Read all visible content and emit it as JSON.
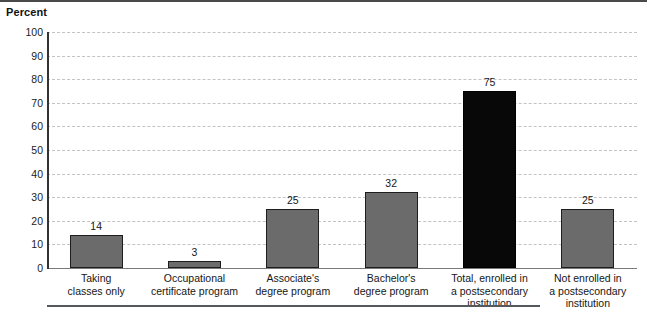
{
  "chart_data": {
    "type": "bar",
    "title": "",
    "ylabel": "Percent",
    "xlabel": "",
    "ylim": [
      0,
      100
    ],
    "yticks": [
      0,
      10,
      20,
      30,
      40,
      50,
      60,
      70,
      80,
      90,
      100
    ],
    "grid": true,
    "legend": "none",
    "categories": [
      "Taking\nclasses only",
      "Occupational\ncertificate program",
      "Associate's\ndegree program",
      "Bachelor's\ndegree program",
      "Total, enrolled in\na postsecondary\ninstitution",
      "Not enrolled in\na postsecondary\ninstitution"
    ],
    "values": [
      14,
      3,
      25,
      32,
      75,
      25
    ],
    "value_labels": [
      "14",
      "3",
      "25",
      "32",
      "75",
      "25"
    ],
    "bar_colors": [
      "#6b6b6b",
      "#6b6b6b",
      "#6b6b6b",
      "#6b6b6b",
      "#080808",
      "#6b6b6b"
    ]
  },
  "colors": {
    "bar_gray": "#6b6b6b",
    "bar_black": "#080808",
    "gridline": "#c3c3c3",
    "axis": "#333333",
    "text": "#161616"
  }
}
